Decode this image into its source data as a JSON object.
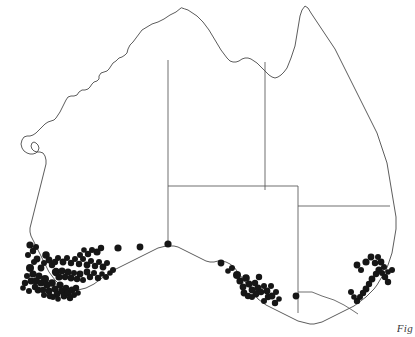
{
  "figure": {
    "caption": "Fig",
    "background_color": "#ffffff",
    "outline_color": "#4a4a4a",
    "border_color": "#555555",
    "dot_color": "#161616"
  },
  "map": {
    "region_name": "Australia",
    "projection_note": "mainland only, no Tasmania",
    "coastline_path": "M 181 8 L 176 12 L 170 15 L 164 19 L 158 22 L 152 24 L 147 27 L 142 30 L 139 34 L 136 38 L 133 42 L 130 45 L 128 49 L 127 53 L 125 55 L 122 57 L 119 58 L 116 61 L 113 63 L 111 66 L 109 69 L 107 71 L 104 72 L 101 73 L 99 76 L 99 79 L 97 81 L 94 82 L 92 84 L 90 87 L 88 89 L 85 90 L 82 90 L 79 92 L 77 95 L 74 96 L 71 96 L 68 97 L 66 100 L 64 104 L 62 108 L 60 112 L 58 115 L 56 118 L 54 120 L 51 121 L 48 122 L 45 124 L 42 127 L 39 130 L 36 133 L 33 135 L 30 136 L 27 136 L 24 137 L 22 140 L 21 144 L 22 148 L 24 151 L 27 153 L 30 154 L 33 154 L 36 153 L 38 151 L 39 148 L 38 145 L 36 143 L 34 142 L 32 143 L 31 146 L 32 149 L 34 151 L 37 152 L 40 152 L 43 153 L 45 156 L 46 160 L 46 164 L 45 168 L 44 172 L 43 176 L 42 180 L 41 184 L 40 188 L 39 192 L 38 196 L 37 200 L 36 204 L 35 208 L 34 212 L 33 216 L 32 220 L 31 224 L 30 228 L 30 232 L 31 236 L 33 240 L 35 244 L 37 248 L 39 252 L 41 256 L 43 260 L 45 264 L 47 268 L 49 272 L 52 276 L 55 280 L 58 283 L 62 286 L 66 288 L 70 289 L 74 290 L 78 290 L 82 289 L 86 288 L 90 286 L 94 284 L 98 281 L 102 278 L 106 275 L 110 272 L 114 270 L 118 268 L 122 266 L 126 264 L 130 262 L 134 260 L 138 258 L 142 256 L 146 254 L 150 252 L 154 250 L 158 248 L 162 247 L 166 246 L 170 246 L 174 246 L 178 247 L 182 249 L 186 251 L 190 253 L 194 255 L 198 257 L 202 259 L 206 261 L 210 262 L 214 262 L 218 261 L 222 261 L 226 262 L 230 264 L 234 267 L 237 271 L 240 275 L 243 279 L 246 283 L 249 287 L 252 291 L 255 295 L 258 299 L 262 302 L 266 305 L 270 307 L 274 309 L 278 311 L 282 313 L 286 315 L 290 317 L 294 319 L 298 321 L 302 322 L 306 323 L 310 324 L 314 324 L 318 323 L 322 322 L 326 320 L 330 318 L 334 316 L 338 314 L 342 312 L 346 310 L 350 308 L 354 306 L 358 303 L 362 300 L 366 297 L 370 293 L 374 289 L 377 285 L 380 280 L 383 275 L 386 270 L 388 265 L 390 259 L 392 253 L 393 247 L 394 241 L 395 235 L 396 229 L 396 223 L 396 217 L 395 211 L 394 205 L 393 199 L 392 193 L 391 187 L 390 181 L 389 175 L 388 169 L 387 163 L 385 157 L 383 151 L 381 145 L 379 139 L 377 133 L 374 127 L 371 121 L 368 115 L 365 109 L 362 103 L 359 97 L 356 91 L 353 85 L 350 79 L 347 73 L 344 67 L 341 61 L 338 55 L 335 49 L 331 43 L 327 37 L 323 31 L 319 25 L 315 19 L 311 13 L 308 8 L 305 6 L 302 10 L 300 16 L 299 22 L 298 28 L 297 34 L 296 40 L 295 46 L 293 52 L 291 58 L 289 63 L 287 68 L 284 72 L 281 75 L 278 77 L 275 78 L 272 77 L 269 75 L 266 72 L 263 69 L 260 66 L 257 63 L 254 61 L 251 59 L 248 58 L 245 58 L 242 59 L 239 61 L 236 62 L 233 62 L 230 61 L 227 58 L 224 54 L 221 50 L 218 45 L 215 40 L 212 35 L 209 30 L 206 26 L 203 22 L 200 19 L 197 16 L 194 14 L 191 12 L 188 10 L 185 9 Z",
    "state_borders": [
      {
        "name": "wa-nt-sa-western-border",
        "path": "M 168 60 L 168 244"
      },
      {
        "name": "nt-qld-border",
        "path": "M 265 62 L 265 190"
      },
      {
        "name": "sa-northern-border",
        "path": "M 168 186 L 298 186"
      },
      {
        "name": "sa-nsw-qld-eastern-border",
        "path": "M 298 186 L 298 313"
      },
      {
        "name": "nsw-qld-border",
        "path": "M 298 206 L 390 206"
      },
      {
        "name": "nsw-vic-border",
        "path": "M 298 292 L 312 292 L 322 296 L 334 300 L 344 305 L 352 310 L 358 314"
      }
    ],
    "dots": {
      "symbol": "filled-circle",
      "count": 128,
      "points": [
        [
          30,
          268,
          4.0
        ],
        [
          33,
          274,
          3.6
        ],
        [
          31,
          281,
          3.4
        ],
        [
          35,
          287,
          3.2
        ],
        [
          29,
          291,
          3.0
        ],
        [
          36,
          281,
          3.8
        ],
        [
          39,
          276,
          3.4
        ],
        [
          41,
          283,
          3.6
        ],
        [
          38,
          290,
          3.4
        ],
        [
          43,
          290,
          3.2
        ],
        [
          45,
          279,
          4.0
        ],
        [
          47,
          285,
          3.6
        ],
        [
          49,
          291,
          3.4
        ],
        [
          44,
          295,
          3.0
        ],
        [
          50,
          296,
          3.2
        ],
        [
          52,
          283,
          3.8
        ],
        [
          55,
          289,
          3.6
        ],
        [
          57,
          294,
          3.4
        ],
        [
          53,
          297,
          3.0
        ],
        [
          58,
          299,
          2.8
        ],
        [
          60,
          285,
          3.6
        ],
        [
          62,
          291,
          3.8
        ],
        [
          64,
          296,
          3.4
        ],
        [
          66,
          288,
          3.2
        ],
        [
          68,
          293,
          3.6
        ],
        [
          70,
          298,
          3.2
        ],
        [
          72,
          290,
          3.4
        ],
        [
          74,
          295,
          3.0
        ],
        [
          76,
          288,
          3.2
        ],
        [
          78,
          293,
          2.8
        ],
        [
          46,
          255,
          3.8
        ],
        [
          49,
          260,
          3.4
        ],
        [
          52,
          265,
          3.2
        ],
        [
          44,
          263,
          3.0
        ],
        [
          41,
          268,
          3.4
        ],
        [
          37,
          259,
          3.4
        ],
        [
          34,
          262,
          3.0
        ],
        [
          27,
          276,
          3.0
        ],
        [
          25,
          283,
          3.2
        ],
        [
          23,
          288,
          2.8
        ],
        [
          56,
          272,
          4.2
        ],
        [
          59,
          277,
          3.6
        ],
        [
          62,
          271,
          3.4
        ],
        [
          65,
          277,
          3.2
        ],
        [
          68,
          272,
          3.6
        ],
        [
          71,
          278,
          3.4
        ],
        [
          74,
          273,
          3.0
        ],
        [
          77,
          279,
          3.2
        ],
        [
          80,
          274,
          3.4
        ],
        [
          83,
          280,
          3.0
        ],
        [
          55,
          262,
          3.2
        ],
        [
          58,
          258,
          3.0
        ],
        [
          63,
          262,
          3.4
        ],
        [
          67,
          258,
          3.0
        ],
        [
          71,
          263,
          3.2
        ],
        [
          75,
          259,
          3.0
        ],
        [
          79,
          264,
          3.2
        ],
        [
          83,
          259,
          3.0
        ],
        [
          87,
          265,
          3.4
        ],
        [
          91,
          261,
          3.0
        ],
        [
          95,
          266,
          3.2
        ],
        [
          99,
          262,
          3.0
        ],
        [
          103,
          267,
          3.4
        ],
        [
          107,
          263,
          3.0
        ],
        [
          97,
          252,
          3.6
        ],
        [
          101,
          248,
          3.2
        ],
        [
          92,
          250,
          3.0
        ],
        [
          88,
          254,
          3.2
        ],
        [
          84,
          250,
          2.8
        ],
        [
          80,
          255,
          3.0
        ],
        [
          30,
          245,
          3.6
        ],
        [
          33,
          251,
          3.2
        ],
        [
          28,
          255,
          3.0
        ],
        [
          36,
          247,
          3.0
        ],
        [
          87,
          272,
          3.4
        ],
        [
          90,
          277,
          3.2
        ],
        [
          94,
          273,
          3.0
        ],
        [
          98,
          278,
          3.2
        ],
        [
          102,
          274,
          2.8
        ],
        [
          106,
          277,
          3.0
        ],
        [
          110,
          273,
          2.8
        ],
        [
          113,
          270,
          3.0
        ],
        [
          118,
          248,
          3.6
        ],
        [
          140,
          247,
          3.4
        ],
        [
          168,
          244,
          3.6
        ],
        [
          221,
          263,
          3.4
        ],
        [
          237,
          275,
          4.0
        ],
        [
          240,
          281,
          3.6
        ],
        [
          243,
          287,
          3.4
        ],
        [
          246,
          278,
          3.8
        ],
        [
          249,
          284,
          3.6
        ],
        [
          252,
          290,
          3.4
        ],
        [
          255,
          283,
          3.2
        ],
        [
          244,
          293,
          3.4
        ],
        [
          248,
          296,
          3.2
        ],
        [
          252,
          297,
          3.0
        ],
        [
          256,
          294,
          3.4
        ],
        [
          258,
          288,
          3.6
        ],
        [
          261,
          292,
          3.2
        ],
        [
          264,
          286,
          3.0
        ],
        [
          259,
          277,
          3.2
        ],
        [
          267,
          291,
          3.4
        ],
        [
          271,
          286,
          3.0
        ],
        [
          268,
          297,
          3.2
        ],
        [
          264,
          301,
          3.0
        ],
        [
          272,
          296,
          3.4
        ],
        [
          276,
          292,
          3.0
        ],
        [
          275,
          303,
          3.2
        ],
        [
          279,
          299,
          2.8
        ],
        [
          296,
          296,
          3.4
        ],
        [
          232,
          268,
          3.0
        ],
        [
          228,
          271,
          2.8
        ],
        [
          366,
          262,
          3.6
        ],
        [
          371,
          257,
          3.4
        ],
        [
          375,
          263,
          3.2
        ],
        [
          378,
          257,
          3.0
        ],
        [
          381,
          262,
          3.4
        ],
        [
          384,
          267,
          3.0
        ],
        [
          379,
          270,
          3.6
        ],
        [
          376,
          274,
          3.2
        ],
        [
          382,
          273,
          3.0
        ],
        [
          385,
          277,
          3.2
        ],
        [
          388,
          272,
          2.8
        ],
        [
          372,
          279,
          3.4
        ],
        [
          369,
          284,
          3.2
        ],
        [
          366,
          289,
          3.4
        ],
        [
          363,
          293,
          3.2
        ],
        [
          360,
          297,
          3.0
        ],
        [
          357,
          301,
          3.2
        ],
        [
          354,
          297,
          2.8
        ],
        [
          351,
          292,
          3.0
        ],
        [
          388,
          282,
          3.2
        ],
        [
          392,
          270,
          3.0
        ],
        [
          357,
          265,
          3.4
        ],
        [
          361,
          270,
          3.0
        ]
      ]
    }
  }
}
